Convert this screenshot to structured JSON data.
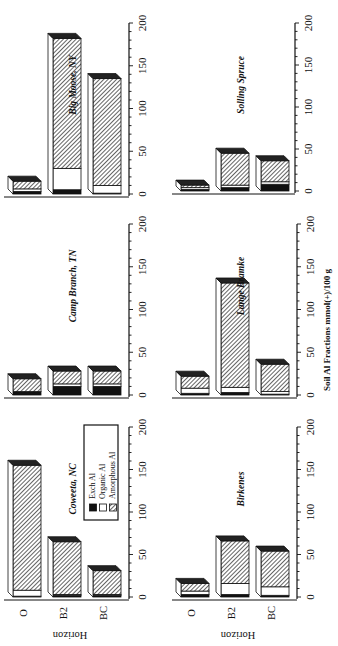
{
  "chart_data": {
    "type": "bar",
    "stacked": true,
    "orientation": "horizontal (figure rotated 90° clockwise)",
    "xlabel": "Soil Al Fractions mmol(+)/100 g",
    "ylabel": "Horizon",
    "xlim": [
      0,
      200
    ],
    "xticks": [
      0,
      50,
      100,
      150,
      200
    ],
    "categories": [
      "O",
      "B2",
      "BC"
    ],
    "legend": {
      "position": "inside Coweeta, NC panel",
      "entries": [
        {
          "label": "Exch Al",
          "fill": "black"
        },
        {
          "label": "Organic Al",
          "fill": "white"
        },
        {
          "label": "Amorphous Al",
          "fill": "hatched"
        }
      ]
    },
    "panels": [
      {
        "title": "Coweeta, NC",
        "series": [
          {
            "name": "Exch Al",
            "values": [
              1,
              2,
              2
            ]
          },
          {
            "name": "Organic Al",
            "values": [
              7,
              1,
              1
            ]
          },
          {
            "name": "Amorphous Al",
            "values": [
              147,
              62,
              28
            ]
          }
        ]
      },
      {
        "title": "Birkenes",
        "series": [
          {
            "name": "Exch Al",
            "values": [
              3,
              3,
              2
            ]
          },
          {
            "name": "Organic Al",
            "values": [
              4,
              13,
              10
            ]
          },
          {
            "name": "Amorphous Al",
            "values": [
              9,
              50,
              42
            ]
          }
        ]
      },
      {
        "title": "Camp Branch, TN",
        "series": [
          {
            "name": "Exch Al",
            "values": [
              4,
              10,
              10
            ]
          },
          {
            "name": "Organic Al",
            "values": [
              0,
              3,
              3
            ]
          },
          {
            "name": "Amorphous Al",
            "values": [
              15,
              15,
              15
            ]
          }
        ]
      },
      {
        "title": "Lange Bramke",
        "series": [
          {
            "name": "Exch Al",
            "values": [
              2,
              3,
              1
            ]
          },
          {
            "name": "Organic Al",
            "values": [
              6,
              6,
              3
            ]
          },
          {
            "name": "Amorphous Al",
            "values": [
              14,
              122,
              32
            ]
          }
        ]
      },
      {
        "title": "Big Moose, NY",
        "series": [
          {
            "name": "Exch Al",
            "values": [
              3,
              5,
              1
            ]
          },
          {
            "name": "Organic Al",
            "values": [
              3,
              25,
              9
            ]
          },
          {
            "name": "Amorphous Al",
            "values": [
              9,
              152,
              125
            ]
          }
        ]
      },
      {
        "title": "Solling Spruce",
        "series": [
          {
            "name": "Exch Al",
            "values": [
              2,
              4,
              8
            ]
          },
          {
            "name": "Organic Al",
            "values": [
              2,
              3,
              3
            ]
          },
          {
            "name": "Amorphous Al",
            "values": [
              3,
              38,
              25
            ]
          }
        ]
      }
    ]
  },
  "labels": {
    "horizon": "Horizon",
    "xlabel": "Soil Al Fractions mmol(+)/100 g",
    "ticks": [
      "0",
      "50",
      "100",
      "150",
      "200"
    ],
    "cats": [
      "O",
      "B2",
      "BC"
    ],
    "legend": [
      "Exch Al",
      "Organic Al",
      "Amorphous Al"
    ],
    "titles": [
      "Coweeta, NC",
      "Birkenes",
      "Camp Branch, TN",
      "Lange Bramke",
      "Big Moose, NY",
      "Solling Spruce"
    ]
  }
}
